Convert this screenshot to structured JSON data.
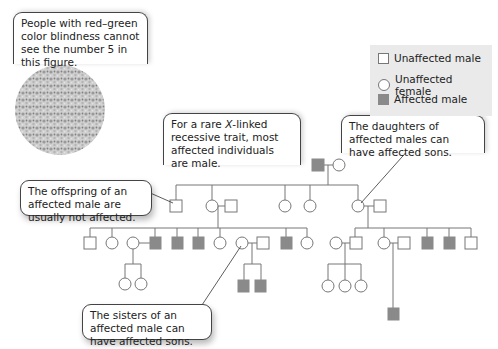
{
  "callouts": {
    "color_blind": "People with red–green color blindness cannot see the number 5 in this figure.",
    "x_linked_pre": "For a rare ",
    "x_linked_italic": "X",
    "x_linked_post": "-linked recessive trait, most affected individuals are male.",
    "daughters": "The daughters of affected males can have affected sons.",
    "offspring": "The offspring of an affected male are usually not affected.",
    "sisters": "The sisters of an affected male can have affected sons."
  },
  "legend": {
    "unaffected_male": "Unaffected male",
    "unaffected_female": "Unaffected female",
    "affected_male": "Affected male"
  },
  "colors": {
    "affected_fill": "#8a8a8a",
    "line": "#777777",
    "legend_bg": "#eaeaea"
  },
  "pedigree": {
    "generation_1": [
      "affected male",
      "unaffected female"
    ],
    "generation_2": [
      "unaffected male",
      "unaffected female (+ unaffected male mate)",
      "unaffected female",
      "unaffected female",
      "unaffected female (+ unaffected male mate)"
    ],
    "generation_3_left": [
      "unaffected male",
      "unaffected female",
      "unaffected female (+ affected male mate)",
      "affected male",
      "affected male",
      "unaffected female",
      "unaffected female (+ unaffected male mate)",
      "affected male",
      "unaffected female"
    ],
    "generation_3_right": [
      "unaffected female (+ unaffected male mate)",
      "unaffected female (+ unaffected male mate)",
      "affected male",
      "affected male",
      "unaffected male"
    ],
    "generation_4": [
      "unaffected female",
      "unaffected female",
      "affected male",
      "affected male",
      "unaffected female",
      "unaffected female",
      "unaffected female",
      "affected male"
    ]
  }
}
